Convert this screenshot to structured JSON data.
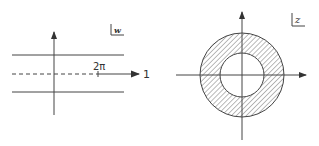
{
  "left_panel": {
    "plane_label": "w",
    "point_label": "2π",
    "arrow_end_label": "1",
    "lines": [
      "upper-boundary",
      "dashed-real-axis",
      "lower-boundary"
    ]
  },
  "right_panel": {
    "plane_label": "z",
    "region": "annulus (hatched)",
    "outer_radius_px": 42,
    "inner_radius_px": 22
  },
  "colors": {
    "ink": "#333333",
    "background": "#ffffff"
  }
}
